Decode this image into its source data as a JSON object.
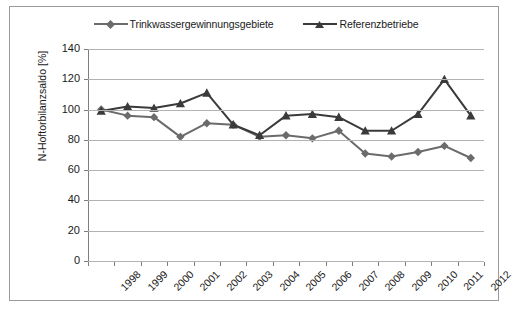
{
  "chart_data": {
    "type": "line",
    "title": "",
    "xlabel": "",
    "ylabel": "N-Hoftorbilanzsaldo [%]",
    "categories": [
      "1998",
      "1999",
      "2000",
      "2001",
      "2002",
      "2003",
      "2004",
      "2005",
      "2006",
      "2007",
      "2008",
      "2009",
      "2010",
      "2011",
      "2012"
    ],
    "ylim": [
      0,
      140
    ],
    "yticks": [
      0,
      20,
      40,
      60,
      80,
      100,
      120,
      140
    ],
    "ytick_labels": [
      "0",
      "20",
      "40",
      "60",
      "80",
      "100",
      "120",
      "140"
    ],
    "grid": true,
    "legend_position": "top",
    "series": [
      {
        "name": "Trinkwassergewinnungsgebiete",
        "marker": "diamond",
        "color": "#6b6b6b",
        "values": [
          100,
          96,
          95,
          82,
          91,
          90,
          82,
          83,
          81,
          86,
          71,
          69,
          72,
          76,
          68
        ]
      },
      {
        "name": "Referenzbetriebe",
        "marker": "triangle",
        "color": "#3a3a3a",
        "values": [
          99,
          102,
          101,
          104,
          111,
          90,
          83,
          96,
          97,
          95,
          86,
          86,
          97,
          120,
          96
        ]
      }
    ]
  },
  "colors": {
    "series1": "#6b6b6b",
    "series2": "#3a3a3a",
    "gridline": "#b3b3b3",
    "axis": "#7d7d7d",
    "frame_border": "#9a9a9a",
    "text": "#1a1a1a",
    "background": "#ffffff"
  }
}
